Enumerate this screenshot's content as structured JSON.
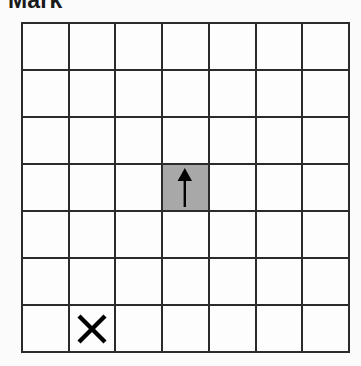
{
  "header": {
    "title": "Mark"
  },
  "grid": {
    "rows": 7,
    "columns": 7,
    "background_color": "#fdfdfd",
    "line_color": "#2b2b2b",
    "shaded_color": "#a8a8a8",
    "marker_color": "#000000",
    "cells": [
      [
        {
          "row": 1,
          "col": 1,
          "shaded": false,
          "marker": "none"
        },
        {
          "row": 1,
          "col": 2,
          "shaded": false,
          "marker": "none"
        },
        {
          "row": 1,
          "col": 3,
          "shaded": false,
          "marker": "none"
        },
        {
          "row": 1,
          "col": 4,
          "shaded": false,
          "marker": "none"
        },
        {
          "row": 1,
          "col": 5,
          "shaded": false,
          "marker": "none"
        },
        {
          "row": 1,
          "col": 6,
          "shaded": false,
          "marker": "none"
        },
        {
          "row": 1,
          "col": 7,
          "shaded": false,
          "marker": "none"
        }
      ],
      [
        {
          "row": 2,
          "col": 1,
          "shaded": false,
          "marker": "none"
        },
        {
          "row": 2,
          "col": 2,
          "shaded": false,
          "marker": "none"
        },
        {
          "row": 2,
          "col": 3,
          "shaded": false,
          "marker": "none"
        },
        {
          "row": 2,
          "col": 4,
          "shaded": false,
          "marker": "none"
        },
        {
          "row": 2,
          "col": 5,
          "shaded": false,
          "marker": "none"
        },
        {
          "row": 2,
          "col": 6,
          "shaded": false,
          "marker": "none"
        },
        {
          "row": 2,
          "col": 7,
          "shaded": false,
          "marker": "none"
        }
      ],
      [
        {
          "row": 3,
          "col": 1,
          "shaded": false,
          "marker": "none"
        },
        {
          "row": 3,
          "col": 2,
          "shaded": false,
          "marker": "none"
        },
        {
          "row": 3,
          "col": 3,
          "shaded": false,
          "marker": "none"
        },
        {
          "row": 3,
          "col": 4,
          "shaded": false,
          "marker": "none"
        },
        {
          "row": 3,
          "col": 5,
          "shaded": false,
          "marker": "none"
        },
        {
          "row": 3,
          "col": 6,
          "shaded": false,
          "marker": "none"
        },
        {
          "row": 3,
          "col": 7,
          "shaded": false,
          "marker": "none"
        }
      ],
      [
        {
          "row": 4,
          "col": 1,
          "shaded": false,
          "marker": "none"
        },
        {
          "row": 4,
          "col": 2,
          "shaded": false,
          "marker": "none"
        },
        {
          "row": 4,
          "col": 3,
          "shaded": false,
          "marker": "none"
        },
        {
          "row": 4,
          "col": 4,
          "shaded": true,
          "marker": "arrow-up"
        },
        {
          "row": 4,
          "col": 5,
          "shaded": false,
          "marker": "none"
        },
        {
          "row": 4,
          "col": 6,
          "shaded": false,
          "marker": "none"
        },
        {
          "row": 4,
          "col": 7,
          "shaded": false,
          "marker": "none"
        }
      ],
      [
        {
          "row": 5,
          "col": 1,
          "shaded": false,
          "marker": "none"
        },
        {
          "row": 5,
          "col": 2,
          "shaded": false,
          "marker": "none"
        },
        {
          "row": 5,
          "col": 3,
          "shaded": false,
          "marker": "none"
        },
        {
          "row": 5,
          "col": 4,
          "shaded": false,
          "marker": "none"
        },
        {
          "row": 5,
          "col": 5,
          "shaded": false,
          "marker": "none"
        },
        {
          "row": 5,
          "col": 6,
          "shaded": false,
          "marker": "none"
        },
        {
          "row": 5,
          "col": 7,
          "shaded": false,
          "marker": "none"
        }
      ],
      [
        {
          "row": 6,
          "col": 1,
          "shaded": false,
          "marker": "none"
        },
        {
          "row": 6,
          "col": 2,
          "shaded": false,
          "marker": "none"
        },
        {
          "row": 6,
          "col": 3,
          "shaded": false,
          "marker": "none"
        },
        {
          "row": 6,
          "col": 4,
          "shaded": false,
          "marker": "none"
        },
        {
          "row": 6,
          "col": 5,
          "shaded": false,
          "marker": "none"
        },
        {
          "row": 6,
          "col": 6,
          "shaded": false,
          "marker": "none"
        },
        {
          "row": 6,
          "col": 7,
          "shaded": false,
          "marker": "none"
        }
      ],
      [
        {
          "row": 7,
          "col": 1,
          "shaded": false,
          "marker": "none"
        },
        {
          "row": 7,
          "col": 2,
          "shaded": false,
          "marker": "cross"
        },
        {
          "row": 7,
          "col": 3,
          "shaded": false,
          "marker": "none"
        },
        {
          "row": 7,
          "col": 4,
          "shaded": false,
          "marker": "none"
        },
        {
          "row": 7,
          "col": 5,
          "shaded": false,
          "marker": "none"
        },
        {
          "row": 7,
          "col": 6,
          "shaded": false,
          "marker": "none"
        },
        {
          "row": 7,
          "col": 7,
          "shaded": false,
          "marker": "none"
        }
      ]
    ]
  }
}
